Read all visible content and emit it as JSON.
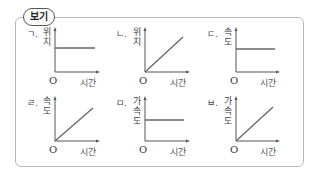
{
  "box": {
    "tag": "보기"
  },
  "graphs": [
    {
      "id": "g1",
      "label": "ㄱ.",
      "ylabel_chars": [
        "위",
        "치"
      ],
      "xlabel": "시간",
      "origin": "O",
      "shape": "horizontal"
    },
    {
      "id": "g2",
      "label": "ㄴ.",
      "ylabel_chars": [
        "위",
        "치"
      ],
      "xlabel": "시간",
      "origin": "O",
      "shape": "increasing-line"
    },
    {
      "id": "g3",
      "label": "ㄷ.",
      "ylabel_chars": [
        "속",
        "도"
      ],
      "xlabel": "시간",
      "origin": "O",
      "shape": "horizontal"
    },
    {
      "id": "g4",
      "label": "ㄹ.",
      "ylabel_chars": [
        "속",
        "도"
      ],
      "xlabel": "시간",
      "origin": "O",
      "shape": "increasing-line"
    },
    {
      "id": "g5",
      "label": "ㅁ.",
      "ylabel_chars": [
        "가",
        "속",
        "도"
      ],
      "xlabel": "시간",
      "origin": "O",
      "shape": "horizontal"
    },
    {
      "id": "g6",
      "label": "ㅂ.",
      "ylabel_chars": [
        "가",
        "속",
        "도"
      ],
      "xlabel": "시간",
      "origin": "O",
      "shape": "increasing-line"
    }
  ],
  "colors": {
    "axis": "#555555",
    "line": "#555555",
    "border": "#b8b8b8"
  }
}
